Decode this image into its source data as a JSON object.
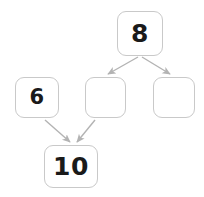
{
  "diagram": {
    "type": "number-bond-tree",
    "background_color": "#ffffff",
    "box_border_color": "#c9c9c9",
    "box_fill_color": "#ffffff",
    "arrow_color": "#b3b3b3",
    "text_color": "#1a1a1a",
    "nodes": [
      {
        "id": "top",
        "label": "8",
        "empty": false,
        "x": 117,
        "y": 11,
        "width": 46,
        "height": 45,
        "font_size": 25
      },
      {
        "id": "mid-left",
        "label": "6",
        "empty": false,
        "x": 15,
        "y": 77,
        "width": 44,
        "height": 41,
        "font_size": 21
      },
      {
        "id": "mid-center",
        "label": "",
        "empty": true,
        "x": 85,
        "y": 77,
        "width": 41,
        "height": 41,
        "font_size": 21
      },
      {
        "id": "mid-right",
        "label": "",
        "empty": true,
        "x": 153,
        "y": 77,
        "width": 42,
        "height": 41,
        "font_size": 21
      },
      {
        "id": "bottom",
        "label": "10",
        "empty": false,
        "x": 44,
        "y": 145,
        "width": 54,
        "height": 43,
        "font_size": 25
      }
    ],
    "edges": [
      {
        "id": "top-to-mid-center",
        "from": "top",
        "to": "mid-center",
        "x1": 138,
        "y1": 57,
        "x2": 108,
        "y2": 74
      },
      {
        "id": "top-to-mid-right",
        "from": "top",
        "to": "mid-right",
        "x1": 142,
        "y1": 57,
        "x2": 170,
        "y2": 74
      },
      {
        "id": "mid-left-to-bottom",
        "from": "mid-left",
        "to": "bottom",
        "x1": 45,
        "y1": 120,
        "x2": 70,
        "y2": 142
      },
      {
        "id": "mid-center-to-bottom",
        "from": "mid-center",
        "to": "bottom",
        "x1": 95,
        "y1": 120,
        "x2": 77,
        "y2": 142
      }
    ]
  }
}
